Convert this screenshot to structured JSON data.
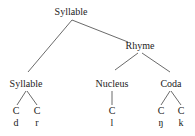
{
  "tree": {
    "root": {
      "label": "Syllable",
      "x": 71,
      "y": 7
    },
    "nodes": [
      {
        "id": "onset",
        "label": "Syllable",
        "x": 26,
        "y": 79
      },
      {
        "id": "rhyme",
        "label": "Rhyme",
        "x": 140,
        "y": 41
      },
      {
        "id": "nucleus",
        "label": "Nucleus",
        "x": 112,
        "y": 79
      },
      {
        "id": "coda",
        "label": "Coda",
        "x": 171,
        "y": 79
      }
    ],
    "leaves": [
      {
        "cv": "C",
        "segment": "d",
        "x": 16
      },
      {
        "cv": "C",
        "segment": "r",
        "x": 37
      },
      {
        "cv": "C",
        "segment": "l",
        "x": 112
      },
      {
        "cv": "C",
        "segment": "ŋ",
        "x": 161
      },
      {
        "cv": "C",
        "segment": "k",
        "x": 181
      }
    ]
  },
  "colors": {
    "line": "#333333",
    "text": "#222222"
  }
}
